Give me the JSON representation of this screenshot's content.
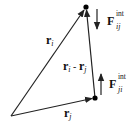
{
  "diagram": {
    "type": "vector-diagram",
    "labels": {
      "r_i": {
        "main": "r",
        "sub": "i"
      },
      "r_j": {
        "main": "r",
        "sub": "j"
      },
      "r_diff": {
        "main_a": "r",
        "sub_a": "i",
        "sep": " - ",
        "main_b": "r",
        "sub_b": "j"
      },
      "F_ij": {
        "main": "F",
        "sub": "ij",
        "sup": "int"
      },
      "F_ji": {
        "main": "F",
        "sub": "ji",
        "sup": "int"
      }
    },
    "points": {
      "origin": [
        11,
        116
      ],
      "particle_i": [
        86,
        7
      ],
      "particle_j": [
        95,
        98
      ]
    },
    "colors": {
      "line": "#222222",
      "point": "#000000",
      "background": "#ffffff"
    }
  }
}
